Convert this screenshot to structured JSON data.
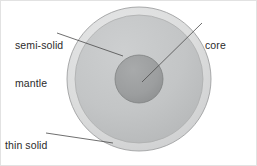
{
  "figure": {
    "background_color": "#ffffff",
    "border_color": "#d8d8d8",
    "line_color": "#4a4a4a",
    "text_color": "#2b2b2b"
  },
  "labels": {
    "mantle": {
      "line1": "semi-solid",
      "line2": "mantle",
      "full": "semi-solid mantle"
    },
    "core": {
      "line1": "core",
      "full": "core"
    },
    "crust": {
      "line1": "thin solid",
      "line2": "crust",
      "full": "thin solid crust"
    }
  },
  "diagram": {
    "type": "concentric-cross-section",
    "center": {
      "x": 139,
      "y": 79
    },
    "layers": [
      {
        "id": "crust",
        "name": "thin solid crust",
        "shape": "ring",
        "outer_radius": 72,
        "inner_radius": 64,
        "fill": "#d9dadb",
        "stroke": "#9a9a9a"
      },
      {
        "id": "mantle",
        "name": "semi-solid mantle",
        "shape": "disc",
        "outer_radius": 64,
        "inner_radius": 24,
        "fill": "#c2c4c5",
        "stroke": "#a8a9aa"
      },
      {
        "id": "core",
        "name": "core",
        "shape": "disc",
        "outer_radius": 24,
        "inner_radius": 0,
        "fill": "#9d9fa0",
        "stroke": "#808182"
      }
    ],
    "leader_lines": [
      {
        "id": "mantle-leader",
        "from": {
          "x": 57,
          "y": 33
        },
        "to": {
          "x": 123,
          "y": 56
        }
      },
      {
        "id": "core-leader",
        "from": {
          "x": 202,
          "y": 23
        },
        "to": {
          "x": 142,
          "y": 82
        }
      },
      {
        "id": "crust-leader",
        "from": {
          "x": 46,
          "y": 133
        },
        "to": {
          "x": 113,
          "y": 143
        }
      }
    ]
  }
}
